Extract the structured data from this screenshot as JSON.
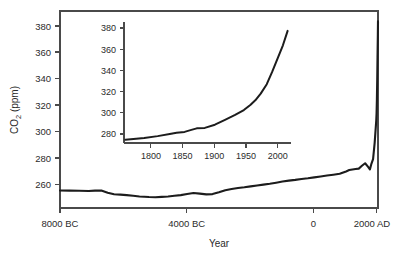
{
  "chart_data": {
    "type": "line",
    "title": "",
    "xlabel": "Year",
    "ylabel": "CO2 (ppm)",
    "ylabel_parts": {
      "prefix": "CO",
      "subscript": "2",
      "suffix": " (ppm)"
    },
    "grid": false,
    "legend": "none",
    "xlim": [
      -8000,
      2005
    ],
    "ylim": [
      252,
      385
    ],
    "xticks": [
      -8000,
      -4000,
      0,
      2000
    ],
    "xtick_labels": [
      "8000 BC",
      "4000 BC",
      "0",
      "2000 AD"
    ],
    "yticks": [
      260,
      280,
      300,
      320,
      340,
      360,
      380
    ],
    "ytick_labels": [
      "260",
      "280",
      "300",
      "320",
      "340",
      "360",
      "380"
    ],
    "series": [
      {
        "name": "Atmospheric CO2",
        "x": [
          -8000,
          -7700,
          -7400,
          -7100,
          -6900,
          -6700,
          -6500,
          -6300,
          -6100,
          -5900,
          -5700,
          -5500,
          -5200,
          -5000,
          -4800,
          -4600,
          -4400,
          -4200,
          -4000,
          -3800,
          -3600,
          -3400,
          -3200,
          -3000,
          -2800,
          -2600,
          -2400,
          -2200,
          -2000,
          -1800,
          -1600,
          -1400,
          -1200,
          -1000,
          -800,
          -600,
          -400,
          -200,
          0,
          200,
          400,
          600,
          800,
          1000,
          1100,
          1200,
          1300,
          1400,
          1500,
          1600,
          1700,
          1750,
          1800,
          1850,
          1900,
          1950,
          1960,
          1970,
          1980,
          1990,
          2000,
          2005
        ],
        "y": [
          263.8,
          263.7,
          263.6,
          263.5,
          263.7,
          263.8,
          262.3,
          261.3,
          261.0,
          260.7,
          260.3,
          259.8,
          259.4,
          259.3,
          259.5,
          259.8,
          260.3,
          260.7,
          261.4,
          262.1,
          261.7,
          261.2,
          261.4,
          262.6,
          264.0,
          264.8,
          265.5,
          266.0,
          266.6,
          267.2,
          267.8,
          268.4,
          269.1,
          269.9,
          270.5,
          271.0,
          271.6,
          272.1,
          272.7,
          273.3,
          273.9,
          274.5,
          275.1,
          276.7,
          277.6,
          278.0,
          278.3,
          278.6,
          280.5,
          282.2,
          279.6,
          278.0,
          282.0,
          285.0,
          296.0,
          311.0,
          316.0,
          325.0,
          338.0,
          354.0,
          369.0,
          378.0
        ]
      }
    ],
    "inset": {
      "type": "line",
      "xlim": [
        1760,
        2008
      ],
      "ylim": [
        274,
        383
      ],
      "xticks": [
        1800,
        1850,
        1900,
        1950,
        2000
      ],
      "xtick_labels": [
        "1800",
        "1850",
        "1900",
        "1950",
        "2000"
      ],
      "yticks": [
        280,
        300,
        320,
        340,
        360,
        380
      ],
      "ytick_labels": [
        "280",
        "300",
        "320",
        "340",
        "360",
        "380"
      ],
      "series": [
        {
          "name": "Atmospheric CO2 (recent)",
          "x": [
            1762,
            1790,
            1810,
            1830,
            1838,
            1850,
            1860,
            1868,
            1880,
            1895,
            1910,
            1925,
            1938,
            1948,
            1955,
            1963,
            1972,
            1980,
            1988,
            1996,
            2003
          ],
          "y": [
            277.0,
            278.6,
            280.2,
            282.4,
            283.2,
            284.0,
            285.8,
            287.2,
            287.6,
            290.5,
            294.8,
            299.3,
            303.7,
            308.5,
            312.5,
            318.5,
            327.0,
            338.0,
            350.0,
            362.0,
            375.0
          ]
        }
      ]
    }
  },
  "labels": {
    "xaxis_title": "Year",
    "yaxis_title_prefix": "CO",
    "yaxis_title_sub": "2",
    "yaxis_title_suffix": " (ppm)"
  },
  "colors": {
    "line": "#1c1c1c",
    "axis": "#4a4a4a",
    "text": "#2b2b2b",
    "background": "#ffffff"
  }
}
